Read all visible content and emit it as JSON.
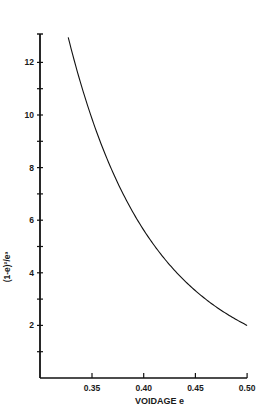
{
  "chart_data": {
    "type": "line",
    "title": "",
    "xlabel": "VOIDAGE e",
    "ylabel": "(1-e)²/e³",
    "xlim": [
      0.3,
      0.5
    ],
    "ylim": [
      0,
      13.1
    ],
    "grid": false,
    "legend": null,
    "x_ticks": [
      "0.35",
      "0.40",
      "0.45",
      "0.50"
    ],
    "y_ticks": [
      "2",
      "4",
      "6",
      "8",
      "10",
      "12"
    ],
    "series": [
      {
        "name": "(1-e)²/e³",
        "x": [
          0.327,
          0.34,
          0.35,
          0.36,
          0.38,
          0.4,
          0.42,
          0.45,
          0.48,
          0.5
        ],
        "y": [
          13.0,
          11.0,
          9.7,
          8.6,
          6.8,
          5.6,
          4.5,
          3.3,
          2.4,
          2.0
        ]
      }
    ]
  }
}
